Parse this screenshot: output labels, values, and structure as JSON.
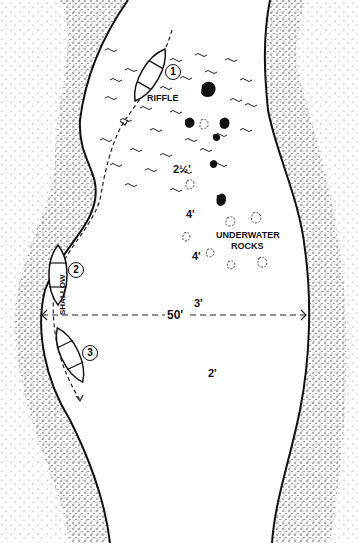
{
  "diagram": {
    "labels": {
      "riffle": "RIFFLE",
      "underwater_rocks_line1": "UNDERWATER",
      "underwater_rocks_line2": "ROCKS",
      "shallow": "SHALLOW",
      "width": "50'"
    },
    "depths": [
      "2½'",
      "4'",
      "4'",
      "3'",
      "2'"
    ],
    "boat_positions": [
      "1",
      "2",
      "3"
    ],
    "colors": {
      "ink": "#111111",
      "background": "#ffffff"
    }
  }
}
